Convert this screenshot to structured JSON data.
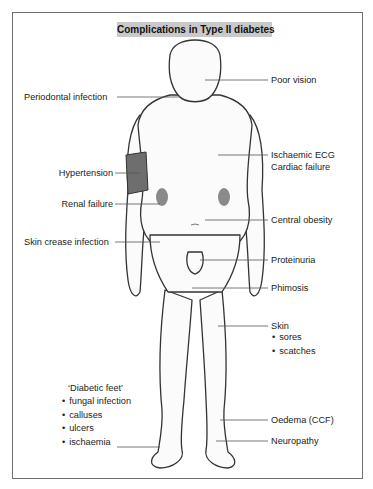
{
  "title": "Complications in Type II diabetes",
  "labels": {
    "poor_vision": "Poor vision",
    "periodontal": "Periodontal infection",
    "ischaemic_ecg": "Ischaemic ECG",
    "cardiac_failure": "Cardiac failure",
    "hypertension": "Hypertension",
    "renal_failure": "Renal failure",
    "central_obesity": "Central obesity",
    "skin_crease": "Skin crease infection",
    "proteinuria": "Proteinuria",
    "phimosis": "Phimosis",
    "skin": "Skin",
    "oedema": "Oedema (CCF)",
    "neuropathy": "Neuropathy"
  },
  "skin_items": [
    "sores",
    "scatches"
  ],
  "diabetic_feet": {
    "heading": "‘Diabetic feet’",
    "items": [
      "fungal infection",
      "calluses",
      "ulcers",
      "ischaemia"
    ]
  },
  "colors": {
    "title_bg": "#c9c9c9",
    "cuff": "#6e6e6e",
    "kidney": "#8a8a8a",
    "outline": "#333333"
  }
}
